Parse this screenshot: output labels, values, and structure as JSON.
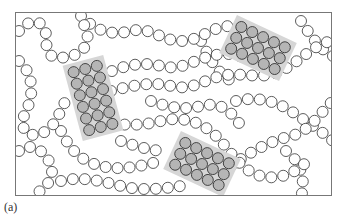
{
  "figure": {
    "label": "(a)",
    "colors": {
      "bead_stroke": "#333333",
      "bead_fill": "#ffffff",
      "crystal_fill": "#b5b5b5",
      "crystal_halo": "#d6d6d6",
      "frame": "#777777"
    },
    "crystalline_regions": [
      {
        "name": "left",
        "center": [
          92,
          97
        ],
        "angle": 75,
        "rows": 3,
        "cols": 6
      },
      {
        "name": "top-right",
        "center": [
          257,
          47
        ],
        "angle": 25,
        "rows": 3,
        "cols": 5
      },
      {
        "name": "bottom-center",
        "center": [
          201,
          163
        ],
        "angle": 25,
        "rows": 3,
        "cols": 5
      }
    ],
    "bead_radius": 6
  }
}
